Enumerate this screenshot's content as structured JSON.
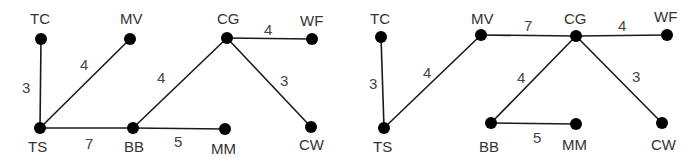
{
  "graphs": [
    {
      "name": "graph-left",
      "nodes": [
        {
          "id": "TC",
          "x": 41,
          "y": 39,
          "lx": 30,
          "ly": 24
        },
        {
          "id": "MV",
          "x": 130,
          "y": 39,
          "lx": 120,
          "ly": 24
        },
        {
          "id": "TS",
          "x": 40,
          "y": 128,
          "lx": 28,
          "ly": 152
        },
        {
          "id": "BB",
          "x": 133,
          "y": 128,
          "lx": 124,
          "ly": 152
        },
        {
          "id": "CG",
          "x": 227,
          "y": 38,
          "lx": 217,
          "ly": 24
        },
        {
          "id": "WF",
          "x": 312,
          "y": 39,
          "lx": 300,
          "ly": 26
        },
        {
          "id": "MM",
          "x": 225,
          "y": 129,
          "lx": 211,
          "ly": 154
        },
        {
          "id": "CW",
          "x": 311,
          "y": 127,
          "lx": 299,
          "ly": 150
        }
      ],
      "edges": [
        {
          "from": "TC",
          "to": "TS",
          "weight": "3",
          "wx": 22,
          "wy": 93
        },
        {
          "from": "TS",
          "to": "MV",
          "weight": "4",
          "wx": 80,
          "wy": 70
        },
        {
          "from": "TS",
          "to": "BB",
          "weight": "7",
          "wx": 85,
          "wy": 149
        },
        {
          "from": "BB",
          "to": "MM",
          "weight": "5",
          "wx": 174,
          "wy": 147
        },
        {
          "from": "BB",
          "to": "CG",
          "weight": "4",
          "wx": 157,
          "wy": 83
        },
        {
          "from": "CG",
          "to": "WF",
          "weight": "4",
          "wx": 264,
          "wy": 35
        },
        {
          "from": "CG",
          "to": "CW",
          "weight": "3",
          "wx": 280,
          "wy": 86
        }
      ]
    },
    {
      "name": "graph-right",
      "nodes": [
        {
          "id": "TC",
          "x": 381,
          "y": 37,
          "lx": 370,
          "ly": 24
        },
        {
          "id": "MV",
          "x": 481,
          "y": 35,
          "lx": 471,
          "ly": 24
        },
        {
          "id": "TS",
          "x": 384,
          "y": 128,
          "lx": 373,
          "ly": 152
        },
        {
          "id": "BB",
          "x": 491,
          "y": 123,
          "lx": 479,
          "ly": 152
        },
        {
          "id": "CG",
          "x": 576,
          "y": 36,
          "lx": 564,
          "ly": 24
        },
        {
          "id": "WF",
          "x": 667,
          "y": 35,
          "lx": 654,
          "ly": 22
        },
        {
          "id": "MM",
          "x": 576,
          "y": 124,
          "lx": 562,
          "ly": 150
        },
        {
          "id": "CW",
          "x": 662,
          "y": 123,
          "lx": 651,
          "ly": 150
        }
      ],
      "edges": [
        {
          "from": "TC",
          "to": "TS",
          "weight": "3",
          "wx": 369,
          "wy": 89
        },
        {
          "from": "TS",
          "to": "MV",
          "weight": "4",
          "wx": 423,
          "wy": 78
        },
        {
          "from": "MV",
          "to": "CG",
          "weight": "7",
          "wx": 524,
          "wy": 31
        },
        {
          "from": "CG",
          "to": "WF",
          "weight": "4",
          "wx": 618,
          "wy": 31
        },
        {
          "from": "CG",
          "to": "BB",
          "weight": "4",
          "wx": 517,
          "wy": 83
        },
        {
          "from": "CG",
          "to": "CW",
          "weight": "3",
          "wx": 632,
          "wy": 82
        },
        {
          "from": "BB",
          "to": "MM",
          "weight": "5",
          "wx": 533,
          "wy": 143
        }
      ]
    }
  ]
}
